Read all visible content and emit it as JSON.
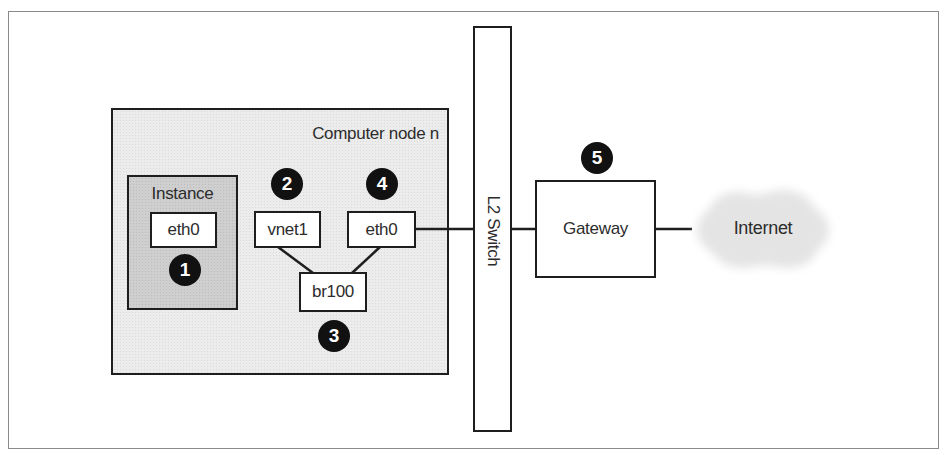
{
  "diagram": {
    "computer_node": {
      "label": "Computer node n"
    },
    "instance": {
      "label": "Instance",
      "interface": "eth0",
      "badge": "1"
    },
    "host": {
      "vnet": {
        "label": "vnet1",
        "badge": "2"
      },
      "bridge": {
        "label": "br100",
        "badge": "3"
      },
      "eth": {
        "label": "eth0",
        "badge": "4"
      }
    },
    "switch": {
      "label": "L2 Switch"
    },
    "gateway": {
      "label": "Gateway",
      "badge": "5"
    },
    "internet": {
      "label": "Internet"
    }
  },
  "colors": {
    "line": "#1e1e1e",
    "node_fill": "#ececec",
    "instance_fill": "#cfcfcf",
    "badge_fill": "#111111",
    "cloud_fill": "#e6e6e6"
  }
}
